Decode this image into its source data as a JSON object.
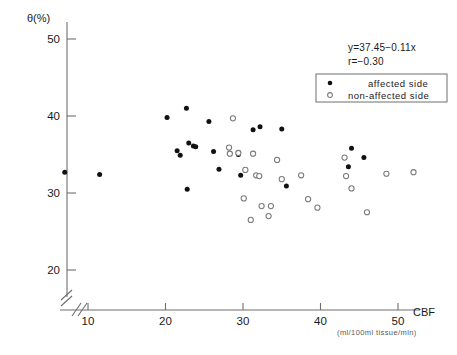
{
  "chart_data": {
    "type": "scatter",
    "title": "",
    "xlabel": "CBF",
    "xunits": "(ml/100ml tissue/min)",
    "ylabel": "θ(%)",
    "xlim": [
      5,
      55
    ],
    "ylim": [
      18,
      52
    ],
    "xticks": [
      10,
      20,
      30,
      40,
      50
    ],
    "yticks": [
      20,
      30,
      40,
      50
    ],
    "xtick_labels": [
      "10",
      "20",
      "30",
      "40",
      "50"
    ],
    "ytick_labels": [
      "20",
      "30",
      "40",
      "50"
    ],
    "grid": false,
    "axis_break": true,
    "annotations": {
      "equation": "y=37.45−0.11x",
      "correlation": "r=−0.30"
    },
    "legend": {
      "position": "top-right",
      "entries": [
        {
          "label": "affected side",
          "marker": "filled-circle",
          "color": "#111111"
        },
        {
          "label": "non-affected side",
          "marker": "open-circle",
          "color": "#7a7a7a"
        }
      ]
    },
    "series": [
      {
        "name": "affected side",
        "marker": "filled-circle",
        "color": "#111111",
        "points": [
          [
            7.0,
            32.7
          ],
          [
            11.5,
            32.4
          ],
          [
            20.2,
            39.8
          ],
          [
            21.5,
            35.5
          ],
          [
            22.7,
            41.0
          ],
          [
            23.0,
            36.5
          ],
          [
            23.6,
            36.1
          ],
          [
            23.9,
            36.0
          ],
          [
            21.9,
            34.9
          ],
          [
            22.8,
            30.5
          ],
          [
            25.6,
            39.3
          ],
          [
            26.2,
            35.4
          ],
          [
            26.9,
            33.1
          ],
          [
            29.4,
            35.0
          ],
          [
            29.7,
            32.3
          ],
          [
            31.3,
            38.2
          ],
          [
            32.2,
            38.6
          ],
          [
            35.0,
            38.3
          ],
          [
            35.6,
            30.9
          ],
          [
            44.0,
            35.8
          ],
          [
            43.6,
            33.4
          ],
          [
            45.6,
            34.6
          ]
        ]
      },
      {
        "name": "non-affected side",
        "marker": "open-circle",
        "color": "#7a7a7a",
        "points": [
          [
            28.7,
            39.7
          ],
          [
            28.2,
            35.9
          ],
          [
            28.3,
            35.1
          ],
          [
            29.4,
            35.2
          ],
          [
            30.3,
            33.0
          ],
          [
            30.1,
            29.3
          ],
          [
            31.3,
            35.1
          ],
          [
            31.7,
            32.3
          ],
          [
            32.1,
            32.2
          ],
          [
            31.0,
            26.5
          ],
          [
            32.4,
            28.3
          ],
          [
            33.6,
            28.3
          ],
          [
            33.3,
            27.0
          ],
          [
            34.4,
            34.3
          ],
          [
            35.0,
            31.8
          ],
          [
            37.5,
            32.3
          ],
          [
            38.4,
            29.2
          ],
          [
            39.6,
            28.1
          ],
          [
            43.1,
            34.6
          ],
          [
            43.3,
            32.2
          ],
          [
            44.0,
            30.6
          ],
          [
            46.0,
            27.5
          ],
          [
            48.5,
            32.5
          ],
          [
            52.0,
            32.7
          ]
        ]
      }
    ]
  },
  "axes_geometry": {
    "x_pixel_of_10": 88,
    "x_pixel_per_unit": 7.75,
    "y_pixel_of_50": 39,
    "y_pixel_per_unit": 7.7
  }
}
